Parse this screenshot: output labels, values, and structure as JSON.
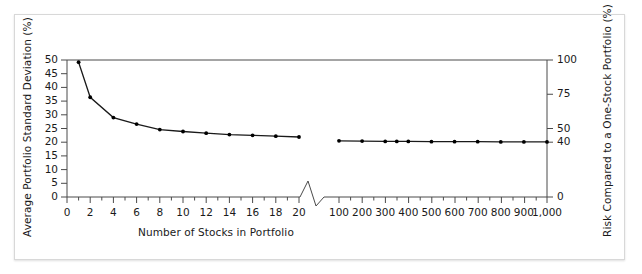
{
  "figure": {
    "background_color": "#ffffff",
    "frame_border_color": "#d8d8d8",
    "line_color": "#1a1a1a",
    "marker_color": "#000000",
    "axis_color": "#4a4a4a"
  },
  "chart_data": {
    "type": "line",
    "title": "",
    "xlabel": "Number of Stocks in Portfolio",
    "ylabel": "Average Portfolio Standard Deviation (%)",
    "ylabel_right": "Risk Compared to a One-Stock Portfolio (%)",
    "ylim": [
      0,
      50
    ],
    "ylim_right": [
      0,
      100
    ],
    "grid": false,
    "legend": "none",
    "axis_break": true,
    "axis_break_note": "x-axis broken between 20 and 100 stocks",
    "yticks_left": [
      0,
      5,
      10,
      15,
      20,
      25,
      30,
      35,
      40,
      45,
      50
    ],
    "yticks_right": [
      0,
      40,
      50,
      75,
      100
    ],
    "xticks_segment1": [
      0,
      2,
      4,
      6,
      8,
      10,
      12,
      14,
      16,
      18,
      20
    ],
    "xticks_segment2": [
      100,
      200,
      300,
      400,
      500,
      600,
      700,
      800,
      900,
      1000
    ],
    "xticklabels_segment2": [
      "100",
      "200",
      "300",
      "400",
      "500",
      "600",
      "700",
      "800",
      "900",
      "1,000"
    ],
    "series": [
      {
        "name": "Average portfolio standard deviation",
        "segment": "1-20 stocks",
        "x": [
          1,
          2,
          4,
          6,
          8,
          10,
          12,
          14,
          16,
          18,
          20
        ],
        "values": [
          49.2,
          36.4,
          29.0,
          26.6,
          24.6,
          23.9,
          23.3,
          22.8,
          22.5,
          22.2,
          21.9
        ]
      },
      {
        "name": "Average portfolio standard deviation",
        "segment": "100-1000 stocks",
        "x": [
          100,
          200,
          300,
          350,
          400,
          500,
          600,
          700,
          800,
          900,
          1000
        ],
        "values": [
          20.5,
          20.4,
          20.3,
          20.3,
          20.3,
          20.2,
          20.2,
          20.2,
          20.1,
          20.1,
          20.1
        ]
      }
    ]
  },
  "axes": {
    "y_left_title": "Average Portfolio Standard Deviation (%)",
    "y_right_title": "Risk Compared to a One-Stock Portfolio (%)",
    "x_title": "Number of Stocks in Portfolio",
    "y_left_ticks": [
      "0",
      "5",
      "10",
      "15",
      "20",
      "25",
      "30",
      "35",
      "40",
      "45",
      "50"
    ],
    "y_right_ticks": [
      "0",
      "40",
      "50",
      "75",
      "100"
    ],
    "x_ticks_left": [
      "0",
      "2",
      "4",
      "6",
      "8",
      "10",
      "12",
      "14",
      "16",
      "18",
      "20"
    ],
    "x_ticks_right": [
      "100",
      "200",
      "300",
      "400",
      "500",
      "600",
      "700",
      "800",
      "900",
      "1,000"
    ]
  }
}
